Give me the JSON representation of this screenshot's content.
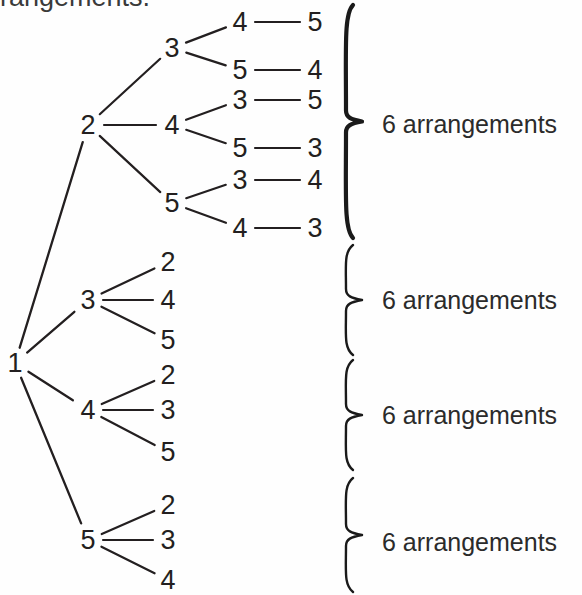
{
  "figure": {
    "type": "tree-diagram",
    "title_clipped": "rrangements.",
    "ink_color": "#231f20",
    "background_color": "#ffffff"
  },
  "tree": {
    "root": {
      "label": "1",
      "x": 15,
      "y": 363
    },
    "level1": [
      {
        "label": "2",
        "x": 88,
        "y": 125
      },
      {
        "label": "3",
        "x": 88,
        "y": 300
      },
      {
        "label": "4",
        "x": 88,
        "y": 410
      },
      {
        "label": "5",
        "x": 88,
        "y": 540
      }
    ],
    "level2": [
      {
        "label": "3",
        "x": 172,
        "y": 48,
        "parent": "2"
      },
      {
        "label": "4",
        "x": 172,
        "y": 125,
        "parent": "2"
      },
      {
        "label": "5",
        "x": 172,
        "y": 203,
        "parent": "2"
      },
      {
        "label": "2",
        "x": 168,
        "y": 262,
        "parent": "3"
      },
      {
        "label": "4",
        "x": 168,
        "y": 300,
        "parent": "3"
      },
      {
        "label": "5",
        "x": 168,
        "y": 340,
        "parent": "3"
      },
      {
        "label": "2",
        "x": 168,
        "y": 375,
        "parent": "4"
      },
      {
        "label": "3",
        "x": 168,
        "y": 410,
        "parent": "4"
      },
      {
        "label": "5",
        "x": 168,
        "y": 452,
        "parent": "4"
      },
      {
        "label": "2",
        "x": 168,
        "y": 505,
        "parent": "5"
      },
      {
        "label": "3",
        "x": 168,
        "y": 540,
        "parent": "5"
      },
      {
        "label": "4",
        "x": 168,
        "y": 580,
        "parent": "5"
      }
    ],
    "level3": [
      {
        "label": "4",
        "x": 240,
        "y": 22,
        "parent": "3"
      },
      {
        "label": "5",
        "x": 240,
        "y": 70,
        "parent": "3"
      },
      {
        "label": "3",
        "x": 240,
        "y": 100,
        "parent": "4"
      },
      {
        "label": "5",
        "x": 240,
        "y": 148,
        "parent": "4"
      },
      {
        "label": "3",
        "x": 240,
        "y": 180,
        "parent": "5"
      },
      {
        "label": "4",
        "x": 240,
        "y": 228,
        "parent": "5"
      }
    ],
    "level4": [
      {
        "label": "5",
        "x": 315,
        "y": 22
      },
      {
        "label": "4",
        "x": 315,
        "y": 70
      },
      {
        "label": "5",
        "x": 315,
        "y": 100
      },
      {
        "label": "3",
        "x": 315,
        "y": 148
      },
      {
        "label": "4",
        "x": 315,
        "y": 180
      },
      {
        "label": "3",
        "x": 315,
        "y": 228
      }
    ]
  },
  "braces": [
    {
      "id": "brace-1",
      "top": 5,
      "bottom": 238,
      "weight": "thick",
      "label": "6 arrangements",
      "label_y": 124
    },
    {
      "id": "brace-2",
      "top": 245,
      "bottom": 355,
      "weight": "thin",
      "label": "6 arrangements",
      "label_y": 300
    },
    {
      "id": "brace-3",
      "top": 360,
      "bottom": 470,
      "weight": "thin",
      "label": "6 arrangements",
      "label_y": 415
    },
    {
      "id": "brace-4",
      "top": 478,
      "bottom": 592,
      "weight": "thin",
      "label": "6 arrangements",
      "label_y": 542
    }
  ],
  "labels": {
    "arrangements_count": "6",
    "arrangements_word": "arrangements",
    "full_label": "6 arrangements"
  }
}
